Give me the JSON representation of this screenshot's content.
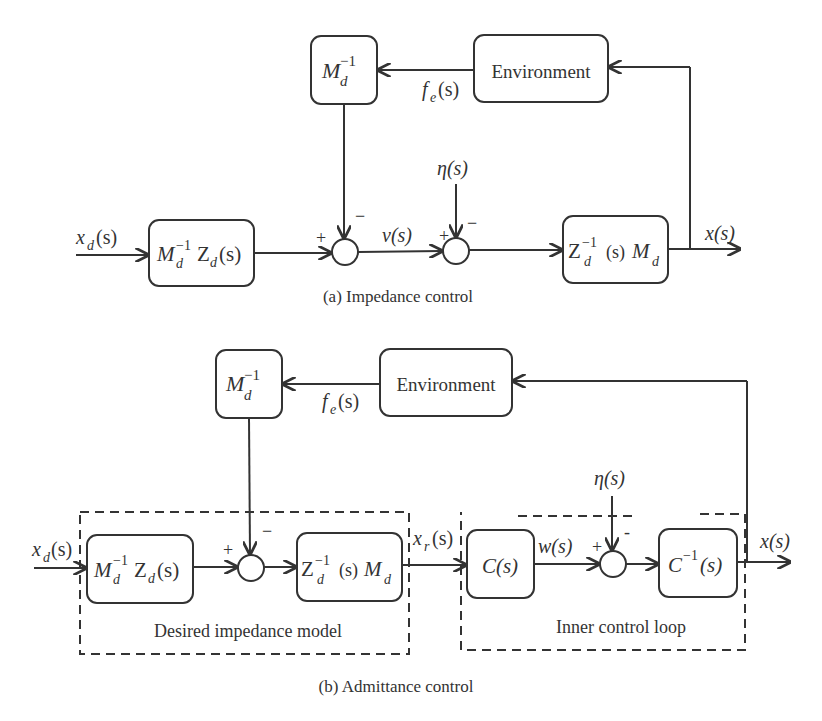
{
  "diagram_a": {
    "caption": "(a) Impedance control",
    "blocks": {
      "minv": {
        "main": "M",
        "sub": "d",
        "sup": "−1"
      },
      "environment": "Environment",
      "input_block": {
        "m": "M",
        "m_sub": "d",
        "m_sup": "−1",
        "z": "Z",
        "z_sub": "d",
        "arg": "(s)"
      },
      "output_block": {
        "z": "Z",
        "z_sub": "d",
        "z_sup": "−1",
        "arg": "(s)",
        "m": "M",
        "m_sub": "d"
      }
    },
    "signals": {
      "input": {
        "main": "x",
        "sub": "d",
        "arg": "(s)"
      },
      "force": {
        "main": "f",
        "sub": "e",
        "arg": "(s)"
      },
      "v": "v(s)",
      "disturbance": "η(s)",
      "output": "x(s)"
    },
    "signs": {
      "sum1_plus": "+",
      "sum1_minus": "−",
      "sum2_plus": "+",
      "sum2_minus": "−"
    }
  },
  "diagram_b": {
    "caption": "(b) Admittance control",
    "blocks": {
      "minv": {
        "main": "M",
        "sub": "d",
        "sup": "−1"
      },
      "environment": "Environment",
      "input_block": {
        "m": "M",
        "m_sub": "d",
        "m_sup": "−1",
        "z": "Z",
        "z_sub": "d",
        "arg": "(s)"
      },
      "impedance_block": {
        "z": "Z",
        "z_sub": "d",
        "z_sup": "−1",
        "arg": "(s)",
        "m": "M",
        "m_sub": "d"
      },
      "controller": "C(s)",
      "plant": {
        "main": "C",
        "sup": "−1",
        "arg": "(s)"
      }
    },
    "signals": {
      "input": {
        "main": "x",
        "sub": "d",
        "arg": "(s)"
      },
      "force": {
        "main": "f",
        "sub": "e",
        "arg": "(s)"
      },
      "reference": {
        "main": "x",
        "sub": "r",
        "arg": "(s)"
      },
      "w": "w(s)",
      "disturbance": "η(s)",
      "output": "x(s)"
    },
    "groups": {
      "desired_impedance": "Desired impedance model",
      "inner_loop": "Inner control loop"
    },
    "signs": {
      "sum1_plus": "+",
      "sum1_minus": "−",
      "sum2_plus": "+",
      "sum2_minus": "-"
    }
  }
}
